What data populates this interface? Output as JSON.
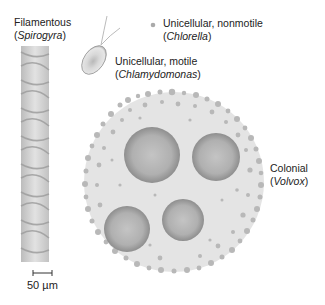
{
  "organisms": [
    {
      "id": "spirogyra",
      "form": "Filamentous",
      "genus": "Spirogyra"
    },
    {
      "id": "chlorella",
      "form": "Unicellular, nonmotile",
      "genus": "Chlorella"
    },
    {
      "id": "chlamydomonas",
      "form": "Unicellular, motile",
      "genus": "Chlamydomonas"
    },
    {
      "id": "volvox",
      "form": "Colonial",
      "genus": "Volvox"
    }
  ],
  "scale_bar": {
    "label": "50 µm"
  },
  "colors": {
    "cell_fill": "#e4e4e4",
    "daughter_colony": "#a8a8a8",
    "cell_dots": "#b8b8b8",
    "text": "#222222"
  }
}
